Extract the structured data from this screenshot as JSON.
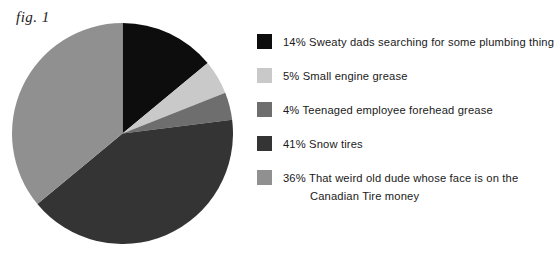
{
  "figure": {
    "label": "fig. 1"
  },
  "chart_data": {
    "type": "pie",
    "title": "fig. 1",
    "xlabel": "",
    "ylabel": "",
    "legend_position": "right",
    "grid": false,
    "start_angle_deg": 0,
    "direction": "clockwise",
    "categories": [
      "Sweaty dads searching for some plumbing thing",
      "Small engine grease",
      "Teenaged employee forehead grease",
      "Snow tires",
      "That weird old dude whose face is on the Canadian Tire money"
    ],
    "values": [
      14,
      5,
      4,
      41,
      36
    ],
    "value_suffix": "%",
    "colors": [
      "#0d0d0d",
      "#c9c9c9",
      "#6e6e6e",
      "#343434",
      "#909090"
    ]
  },
  "legend": {
    "items": [
      {
        "percent": "14%",
        "label": "Sweaty dads searching for some plumbing thing",
        "line1": "14% Sweaty dads searching for some plumbing thing",
        "line2": "",
        "color": "#0d0d0d",
        "swatch_name": "legend-swatch-sweaty-dads"
      },
      {
        "percent": "5%",
        "label": "Small engine grease",
        "line1": "5% Small engine grease",
        "line2": "",
        "color": "#c9c9c9",
        "swatch_name": "legend-swatch-small-engine-grease"
      },
      {
        "percent": "4%",
        "label": "Teenaged employee forehead grease",
        "line1": "4% Teenaged employee forehead grease",
        "line2": "",
        "color": "#6e6e6e",
        "swatch_name": "legend-swatch-teenaged-employee-forehead-grease"
      },
      {
        "percent": "41%",
        "label": "Snow tires",
        "line1": "41% Snow tires",
        "line2": "",
        "color": "#343434",
        "swatch_name": "legend-swatch-snow-tires"
      },
      {
        "percent": "36%",
        "label": "That weird old dude whose face is on the Canadian Tire money",
        "line1": "36% That weird old dude whose face is on the",
        "line2": "Canadian Tire money",
        "color": "#909090",
        "swatch_name": "legend-swatch-canadian-tire-money"
      }
    ]
  },
  "colors": {
    "background": "#ffffff",
    "text": "#1a1a1a",
    "slice_1": "#0d0d0d",
    "slice_2": "#c9c9c9",
    "slice_3": "#6e6e6e",
    "slice_4": "#343434",
    "slice_5": "#909090"
  }
}
